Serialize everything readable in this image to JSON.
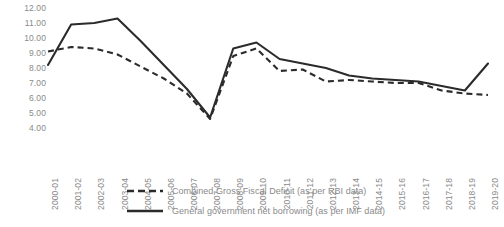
{
  "chart_data": {
    "type": "line",
    "title": "",
    "xlabel": "",
    "ylabel": "",
    "ylim": [
      4.0,
      12.0
    ],
    "ytick_step": 1.0,
    "yticks": [
      "12.00",
      "11.00",
      "10.00",
      "9.00",
      "8.00",
      "7.00",
      "6.00",
      "5.00",
      "4.00"
    ],
    "grid": false,
    "legend_position": "bottom",
    "line_color": "#2b2b2b",
    "text_color": "#8a8a8a",
    "categories": [
      "2000-01",
      "2001-02",
      "2002-03",
      "2003-04",
      "2004-05",
      "2005-06",
      "2006-07",
      "2007-08",
      "2008-09",
      "2009-10",
      "2010-11",
      "2011-12",
      "2012-13",
      "2013-14",
      "2014-15",
      "2015-16",
      "2016-17",
      "2017-18",
      "2018-19",
      "2019-20"
    ],
    "series": [
      {
        "name": "Combined Gross Fiscal Deficit (as per RBI data)",
        "style": "dashed",
        "values": [
          9.1,
          9.4,
          9.3,
          8.9,
          8.1,
          7.3,
          6.3,
          4.6,
          8.8,
          9.3,
          7.8,
          7.9,
          7.1,
          7.2,
          7.1,
          7.0,
          7.0,
          6.5,
          6.3,
          6.2
        ]
      },
      {
        "name": "General government net borrowing (as per IMF data)",
        "style": "solid",
        "values": [
          8.2,
          10.9,
          11.0,
          11.3,
          9.8,
          8.2,
          6.6,
          4.7,
          9.3,
          9.7,
          8.6,
          8.3,
          8.0,
          7.5,
          7.3,
          7.2,
          7.1,
          6.8,
          6.5,
          8.3
        ]
      }
    ]
  },
  "legend": {
    "items": [
      {
        "label": "Combined Gross Fiscal Deficit (as per RBI data)",
        "style": "dashed"
      },
      {
        "label": "General government net borrowing (as per IMF data)",
        "style": "solid"
      }
    ]
  }
}
